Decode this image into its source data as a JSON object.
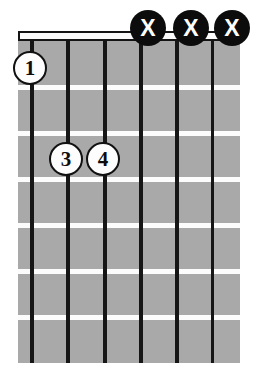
{
  "diagram": {
    "type": "guitar-chord-diagram",
    "orientation": "vertical",
    "string_count": 6,
    "fret_count": 7,
    "starting_fret": 1,
    "nut_shown": true,
    "colors": {
      "fretboard": "#a9a9a9",
      "string": "#161616",
      "fret_line": "#fcfcfc",
      "nut_fill": "#fbfbfb",
      "nut_border": "#141414",
      "finger_marker_fill": "#fdfdfd",
      "finger_marker_text": "#0d0d0d",
      "mute_marker_fill": "#0c0c0c",
      "mute_marker_text": "#ffffff",
      "background": "#ffffff"
    },
    "strings": [
      {
        "index": 1,
        "x": 30
      },
      {
        "index": 2,
        "x": 66
      },
      {
        "index": 3,
        "x": 103
      },
      {
        "index": 4,
        "x": 139
      },
      {
        "index": 5,
        "x": 175
      },
      {
        "index": 6,
        "x": 211
      }
    ],
    "fret_lines": [
      {
        "index": 1,
        "y": 85
      },
      {
        "index": 2,
        "y": 131
      },
      {
        "index": 3,
        "y": 177
      },
      {
        "index": 4,
        "y": 223
      },
      {
        "index": 5,
        "y": 269
      },
      {
        "index": 6,
        "y": 315
      }
    ],
    "finger_markers": [
      {
        "label": "1",
        "string": 1,
        "fret": 1,
        "x": 30,
        "y": 68
      },
      {
        "label": "3",
        "string": 2,
        "fret": 3,
        "x": 66,
        "y": 159
      },
      {
        "label": "4",
        "string": 3,
        "fret": 3,
        "x": 103,
        "y": 159
      }
    ],
    "mute_markers": [
      {
        "label": "X",
        "string": 4,
        "x": 148,
        "y": 28
      },
      {
        "label": "X",
        "string": 5,
        "x": 191,
        "y": 28
      },
      {
        "label": "X",
        "string": 6,
        "x": 232,
        "y": 28
      }
    ]
  }
}
